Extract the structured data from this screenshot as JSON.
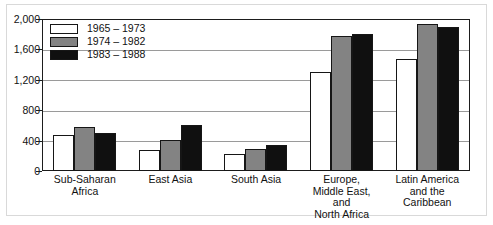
{
  "chart_data": {
    "type": "bar",
    "title": "",
    "subtitle": "",
    "xlabel": "",
    "ylabel": "",
    "ylim": [
      0,
      2000
    ],
    "yticks": [
      "0",
      "400",
      "800",
      "1,200",
      "1,600",
      "2,000"
    ],
    "ytick_values": [
      0,
      400,
      800,
      1200,
      1600,
      2000
    ],
    "grid": true,
    "legend_position": "top-left",
    "categories": [
      "Sub-Saharan\nAfrica",
      "East Asia",
      "South Asia",
      "Europe,\nMiddle East,\nand\nNorth Africa",
      "Latin America\nand the\nCaribbean"
    ],
    "series": [
      {
        "name": "1965 – 1973",
        "color": "#ffffff",
        "values": [
          470,
          280,
          220,
          1300,
          1470
        ]
      },
      {
        "name": "1974 – 1982",
        "color": "#838383",
        "values": [
          580,
          410,
          290,
          1780,
          1935
        ]
      },
      {
        "name": "1983 – 1988",
        "color": "#101010",
        "values": [
          500,
          600,
          340,
          1800,
          1900
        ]
      }
    ]
  },
  "legend": {
    "items": [
      {
        "label": "1965 – 1973"
      },
      {
        "label": "1974 – 1982"
      },
      {
        "label": "1983 – 1988"
      }
    ]
  },
  "axes": {
    "y": {
      "ticks": [
        "2,000",
        "1,600",
        "1,200",
        "800",
        "400",
        "0"
      ]
    },
    "x": {
      "labels": [
        [
          "Sub-Saharan",
          "Africa"
        ],
        [
          "East Asia"
        ],
        [
          "South Asia"
        ],
        [
          "Europe,",
          "Middle East,",
          "and",
          "North Africa"
        ],
        [
          "Latin America",
          "and the",
          "Caribbean"
        ]
      ]
    }
  }
}
